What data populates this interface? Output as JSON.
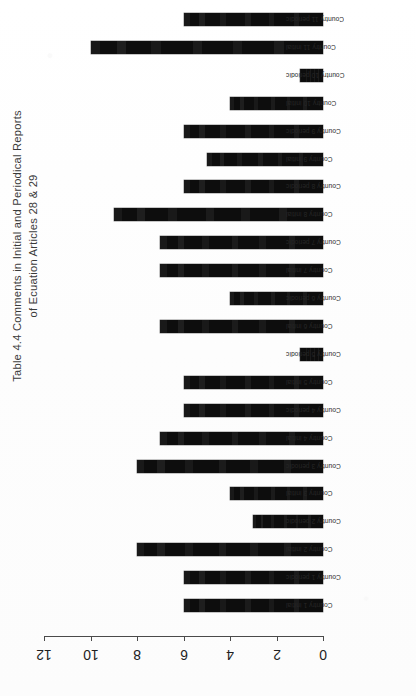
{
  "document": {
    "kind": "scanned-page",
    "orientation_note": "chart rotated 180 degrees on the page",
    "background_color": "#fefefe",
    "ink_color": "#0d0d0d"
  },
  "chart_data": {
    "type": "bar",
    "orientation": "horizontal",
    "title": "Table 4.4 Comments in Initial and Periodical Reports",
    "title_line_1": "Table 4.4 Comments in Initial and Periodical Reports",
    "title_line_2": "of Ecuation Articles 28 & 29",
    "xlabel": "",
    "ylabel": "",
    "xlim": [
      0,
      12
    ],
    "xticks": [
      12,
      10,
      8,
      6,
      4,
      2,
      0
    ],
    "xtick_labels": [
      "12",
      "10",
      "8",
      "6",
      "4",
      "2",
      "0"
    ],
    "grid": false,
    "legend": "none",
    "bar_color": "#0d0d0d",
    "axis_direction": "x axis increases right-to-left (page rotated)",
    "categories": [
      "Country 11 periodic",
      "Country 11 initial",
      "Country 10 periodic",
      "Country 10 initial",
      "Country 9 periodic",
      "Country 9 initial",
      "Country 8 periodic",
      "Country 8 initial",
      "Country 7 periodic",
      "Country 7 initial",
      "Country 6 periodic",
      "Country 6 initial",
      "Country 5 periodic",
      "Country 5 initial",
      "Country 4 periodic",
      "Country 4 initial",
      "Country 3 periodic",
      "Country 3 initial",
      "Country 2 periodic",
      "Country 2 initial",
      "Country 1 periodic",
      "Country 1 initial"
    ],
    "values": [
      6,
      10,
      1,
      4,
      6,
      5,
      6,
      9,
      7,
      7,
      4,
      7,
      1,
      6,
      6,
      7,
      8,
      4,
      3,
      8,
      6,
      6
    ],
    "bars": [
      {
        "label": "Country 11 periodic",
        "value": 6
      },
      {
        "label": "Country 11 initial",
        "value": 10
      },
      {
        "label": "Country 10 periodic",
        "value": 1
      },
      {
        "label": "Country 10 initial",
        "value": 4
      },
      {
        "label": "Country 9 periodic",
        "value": 6
      },
      {
        "label": "Country 9 initial",
        "value": 5
      },
      {
        "label": "Country 8 periodic",
        "value": 6
      },
      {
        "label": "Country 8 initial",
        "value": 9
      },
      {
        "label": "Country 7 periodic",
        "value": 7
      },
      {
        "label": "Country 7 initial",
        "value": 7
      },
      {
        "label": "Country 6 periodic",
        "value": 4
      },
      {
        "label": "Country 6 initial",
        "value": 7
      },
      {
        "label": "Country 5 periodic",
        "value": 1
      },
      {
        "label": "Country 5 initial",
        "value": 6
      },
      {
        "label": "Country 4 periodic",
        "value": 6
      },
      {
        "label": "Country 4 initial",
        "value": 7
      },
      {
        "label": "Country 3 periodic",
        "value": 8
      },
      {
        "label": "Country 3 initial",
        "value": 4
      },
      {
        "label": "Country 2 periodic",
        "value": 3
      },
      {
        "label": "Country 2 initial",
        "value": 8
      },
      {
        "label": "Country 1 periodic",
        "value": 6
      },
      {
        "label": "Country 1 initial",
        "value": 6
      }
    ]
  }
}
